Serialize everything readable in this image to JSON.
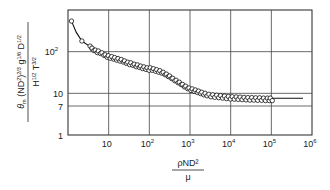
{
  "chart_data": {
    "type": "scatter",
    "title": "",
    "xscale": "log",
    "yscale": "log",
    "xlim": [
      1,
      1000000
    ],
    "ylim": [
      1,
      1000
    ],
    "grid": true,
    "xlabel": {
      "numerator": "ρND²",
      "denominator": "μ"
    },
    "ylabel": {
      "numerator": "θm (ND²)^(2/3) g^(1/6) D^(1/2)",
      "denominator": "H^(1/2) T^(3/2)"
    },
    "x_ticks": [
      {
        "value": 10,
        "base": "10",
        "exp": ""
      },
      {
        "value": 100,
        "base": "10",
        "exp": "2"
      },
      {
        "value": 1000,
        "base": "10",
        "exp": "3"
      },
      {
        "value": 10000,
        "base": "10",
        "exp": "4"
      },
      {
        "value": 100000,
        "base": "10",
        "exp": "5"
      },
      {
        "value": 1000000,
        "base": "10",
        "exp": "6"
      }
    ],
    "y_ticks": [
      {
        "value": 1,
        "base": "1",
        "exp": ""
      },
      {
        "value": 7,
        "base": "7",
        "exp": ""
      },
      {
        "value": 10,
        "base": "10",
        "exp": ""
      },
      {
        "value": 100,
        "base": "10",
        "exp": "2"
      }
    ],
    "series": [
      {
        "name": "experimental data",
        "marker": "open-circle",
        "x": [
          1.22,
          2.2,
          3.5,
          3.9,
          4.7,
          5.6,
          6.8,
          8.2,
          9.8,
          11.9,
          14.1,
          17.0,
          20.4,
          24.5,
          29.4,
          35.3,
          42.4,
          50.9,
          61.1,
          73.3,
          88.0,
          105.6,
          126.7,
          152,
          182,
          219,
          263,
          315,
          378,
          454,
          545,
          654,
          785,
          942,
          1131,
          1357,
          1628,
          1954,
          2345,
          2920,
          3640,
          4540,
          5660,
          7050,
          8790,
          10960,
          13660,
          17030,
          21230,
          26470,
          33000,
          41140,
          51290,
          63940,
          79710,
          94000
        ],
        "y": [
          540,
          180,
          136,
          122,
          109,
          104,
          94,
          84,
          80,
          76,
          72,
          68,
          65,
          60,
          56,
          54,
          50,
          48,
          45,
          43,
          41,
          41,
          39,
          37,
          35,
          32,
          29,
          26,
          23,
          20.5,
          18.5,
          16.4,
          14.8,
          13.4,
          12.8,
          12.0,
          11.3,
          10.6,
          10.0,
          9.5,
          9.2,
          9.0,
          8.8,
          8.6,
          8.4,
          8.3,
          8.2,
          8.1,
          8.0,
          7.9,
          7.9,
          7.8,
          7.8,
          7.7,
          7.7,
          7.7
        ]
      }
    ],
    "fit_curve": {
      "name": "correlation curve",
      "style": "solid",
      "x": [
        1.22,
        1.6,
        2.2,
        3.5,
        6,
        10,
        20,
        50,
        100,
        200,
        400,
        700,
        1000,
        2000,
        5000,
        10000,
        50000,
        100000,
        300000,
        600000
      ],
      "y": [
        540,
        290,
        180,
        132,
        100,
        78,
        65,
        48,
        41,
        33,
        22,
        15.5,
        12.5,
        10.2,
        9.0,
        8.4,
        7.9,
        7.7,
        7.6,
        7.6
      ]
    }
  }
}
